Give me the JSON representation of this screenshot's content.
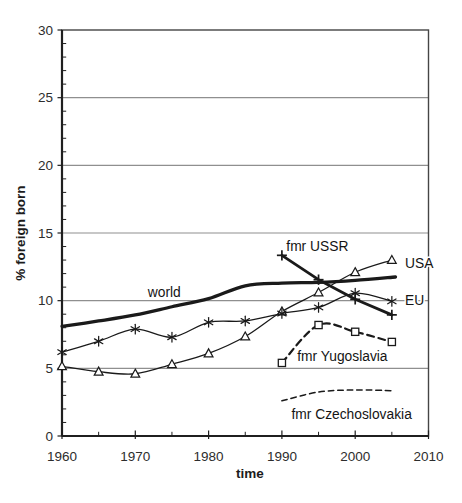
{
  "chart_data": {
    "type": "line",
    "title": "",
    "xlabel": "time",
    "ylabel": "% foreign born",
    "xlim": [
      1960,
      2010
    ],
    "ylim": [
      0,
      30
    ],
    "x_major_ticks": [
      1960,
      1970,
      1980,
      1990,
      2000,
      2010
    ],
    "x_minor_tick_step": 5,
    "y_major_ticks": [
      0,
      5,
      10,
      15,
      20,
      25,
      30
    ],
    "y_minor_tick_step": 1,
    "grid": "horizontal gridlines at y major ticks only",
    "legend": "inline labels next to lines",
    "colors": {
      "background": "#ffffff",
      "line": "#1a1a1a",
      "grid": "#8f8f8f",
      "frame": "#454545",
      "axis": "#1f1f1f",
      "tick_text": "#2d2d2d"
    },
    "series": [
      {
        "name": "world",
        "marker": "none",
        "line_style": "solid-thick",
        "stroke_width": 3.3,
        "smooth": true,
        "x": [
          1960,
          1965,
          1970,
          1975,
          1980,
          1985,
          1990,
          1995,
          2000,
          2005.5
        ],
        "values": [
          8.1,
          8.5,
          8.95,
          9.55,
          10.15,
          11.1,
          11.3,
          11.35,
          11.5,
          11.75
        ],
        "label": {
          "text": "world",
          "x": 1971.7,
          "y": 10.28
        }
      },
      {
        "name": "USA",
        "marker": "triangle",
        "line_style": "solid-thin",
        "stroke_width": 1.3,
        "smooth": true,
        "x": [
          1960,
          1965,
          1970,
          1975,
          1980,
          1985,
          1990,
          1995,
          2000,
          2005
        ],
        "values": [
          5.15,
          4.75,
          4.6,
          5.3,
          6.1,
          7.35,
          9.2,
          10.6,
          12.1,
          13.0
        ],
        "label": {
          "text": "USA",
          "x": 2006.8,
          "y": 12.45
        }
      },
      {
        "name": "EU",
        "marker": "asterisk",
        "line_style": "solid-thin",
        "stroke_width": 1.3,
        "smooth": true,
        "x": [
          1960,
          1965,
          1970,
          1975,
          1980,
          1985,
          1990,
          1995,
          2000,
          2005
        ],
        "values": [
          6.2,
          7.0,
          7.9,
          7.3,
          8.4,
          8.5,
          9.05,
          9.5,
          10.55,
          9.95
        ],
        "label": {
          "text": "EU",
          "x": 2006.8,
          "y": 9.65
        }
      },
      {
        "name": "fmr Yugoslavia",
        "marker": "square",
        "line_style": "dashed",
        "stroke_width": 2.2,
        "dash": "7,4.5",
        "smooth": true,
        "x": [
          1990,
          1995,
          2000,
          2005
        ],
        "values": [
          5.4,
          8.2,
          7.7,
          6.95
        ],
        "label": {
          "text": "fmr Yugoslavia",
          "x": 1992.1,
          "y": 5.55
        }
      },
      {
        "name": "fmr Czechoslovakia",
        "marker": "none",
        "line_style": "dashed-thin",
        "stroke_width": 1.5,
        "dash": "5.5,4",
        "smooth": true,
        "x": [
          1990,
          1995,
          2000,
          2005
        ],
        "values": [
          2.6,
          3.25,
          3.4,
          3.35
        ],
        "label": {
          "text": "fmr Czechoslovakia",
          "x": 1991.3,
          "y": 1.25
        }
      },
      {
        "name": "fmr USSR",
        "marker": "plus",
        "line_style": "solid-thick",
        "stroke_width": 2.8,
        "smooth": false,
        "x": [
          1990,
          1995,
          2000,
          2005
        ],
        "values": [
          13.35,
          11.55,
          10.1,
          8.95
        ],
        "label": {
          "text": "fmr USSR",
          "x": 1990.6,
          "y": 13.65
        }
      }
    ]
  }
}
